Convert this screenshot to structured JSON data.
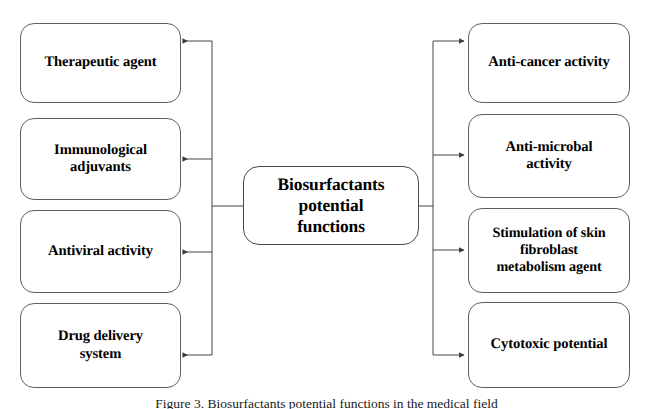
{
  "figure": {
    "background_color": "#ffffff",
    "line_color": "#555555",
    "text_color": "#000000",
    "width": 653,
    "height": 409
  },
  "center": {
    "label": "Biosurfactants potential functions",
    "line1": "Biosurfactants",
    "line2": "potential",
    "line3": "functions"
  },
  "left_branch": {
    "items": [
      {
        "label": "Therapeutic agent",
        "line1": "Therapeutic agent",
        "line2": ""
      },
      {
        "label": "Immunological adjuvants",
        "line1": "Immunological",
        "line2": "adjuvants"
      },
      {
        "label": "Antiviral activity",
        "line1": "Antiviral activity",
        "line2": ""
      },
      {
        "label": "Drug delivery system",
        "line1": "Drug delivery",
        "line2": "system"
      }
    ]
  },
  "right_branch": {
    "items": [
      {
        "label": "Anti-cancer activity",
        "line1": "Anti-cancer activity",
        "line2": "",
        "line3": ""
      },
      {
        "label": "Anti-microbal activity",
        "line1": "Anti-microbal",
        "line2": "activity",
        "line3": ""
      },
      {
        "label": "Stimulation of skin fibroblast metabolism agent",
        "line1": "Stimulation of skin",
        "line2": "fibroblast",
        "line3": "metabolism agent"
      },
      {
        "label": "Cytotoxic potential",
        "line1": "Cytotoxic potential",
        "line2": "",
        "line3": ""
      }
    ]
  },
  "caption": {
    "text": "Figure 3. Biosurfactants potential functions in the medical field"
  }
}
